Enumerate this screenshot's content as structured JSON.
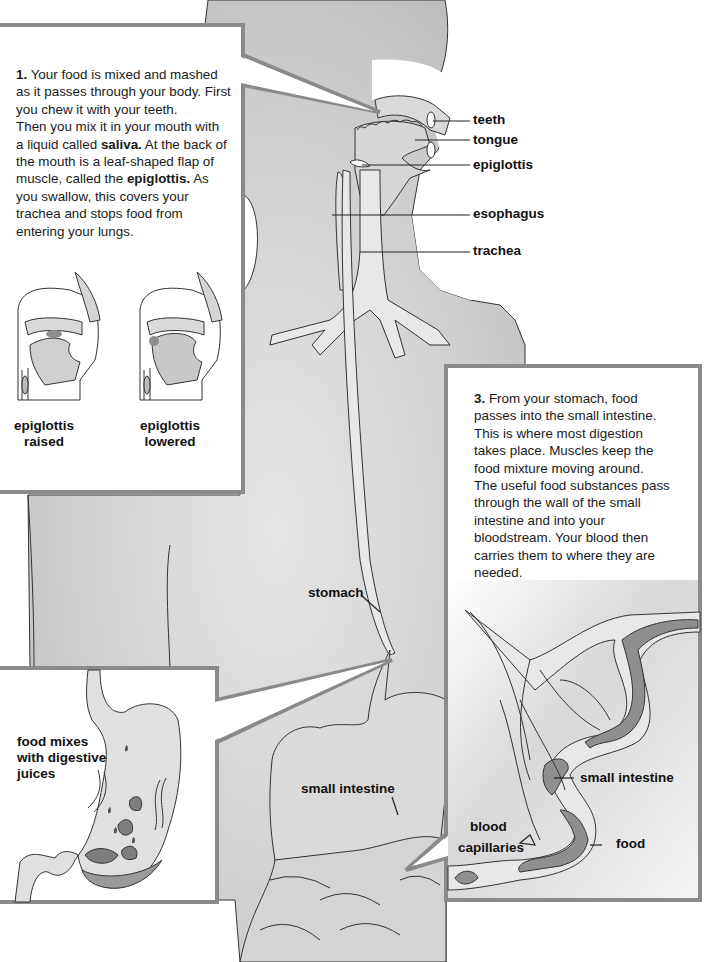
{
  "figure": {
    "colors": {
      "body_fill": "#c9c9c9",
      "organ_fill": "#e3e3e3",
      "box_border": "#8a8a8a",
      "box_fill": "#ffffff",
      "food_fill": "#8f8f8f",
      "outline": "#2a2a2a"
    }
  },
  "box1": {
    "num": "1.",
    "text_parts": [
      "Your food is mixed and mashed as it passes through your body. First you chew it with your teeth. Then you mix it in your mouth with a liquid called ",
      "saliva.",
      " At the back of the mouth is a leaf-shaped flap of muscle, called the ",
      "epiglottis.",
      " As you swallow, this covers your trachea and stops food from entering your lungs."
    ],
    "lines": [
      "Your food is mixed and mashed",
      "as it passes through your body. First",
      "you chew it with your teeth.",
      "Then you mix it in your mouth with",
      "a liquid called",
      "saliva.",
      "At the back of",
      "the mouth is a leaf-shaped flap of",
      "muscle, called the",
      "epiglottis.",
      "As",
      "you swallow, this covers your",
      "trachea and stops food from",
      "entering your lungs."
    ],
    "captions": [
      {
        "line1": "epiglottis",
        "line2": "raised"
      },
      {
        "line1": "epiglottis",
        "line2": "lowered"
      }
    ]
  },
  "head_labels": [
    "teeth",
    "tongue",
    "epiglottis",
    "esophagus",
    "trachea"
  ],
  "body_labels": {
    "stomach": "stomach",
    "small_intestine": "small intestine"
  },
  "box2": {
    "caption_lines": [
      "food mixes",
      "with digestive",
      "juices"
    ]
  },
  "box3": {
    "num": "3.",
    "lines": [
      "From your stomach, food",
      "passes into the small intestine.",
      "This is where most digestion",
      "takes place. Muscles keep the",
      "food mixture moving around.",
      "The useful food substances pass",
      "through the wall of the small",
      "intestine and into your",
      "bloodstream. Your blood then",
      "carries them to where they are",
      "needed."
    ],
    "labels": {
      "small_intestine": "small intestine",
      "blood_line1": "blood",
      "blood_line2": "capillaries",
      "food": "food"
    }
  }
}
